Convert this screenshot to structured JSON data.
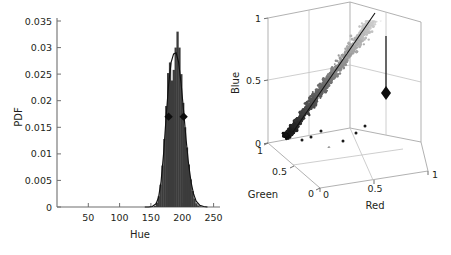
{
  "figure": {
    "background_color": "#ffffff",
    "ink_color": "#231f20"
  },
  "panels": [
    {
      "id": "hue-pdf",
      "type": "histogram-density"
    },
    {
      "id": "rgb-scatter3d",
      "type": "scatter3d"
    }
  ],
  "left_panel": {
    "xlabel": "Hue",
    "ylabel": "PDF",
    "x_ticks": [
      "50",
      "100",
      "150",
      "200",
      "250"
    ],
    "y_ticks": [
      "0",
      "0.005",
      "0.01",
      "0.015",
      "0.02",
      "0.025",
      "0.03",
      "0.035"
    ]
  },
  "right_panel": {
    "xlabel": "Red",
    "ylabel": "Green",
    "zlabel": "Blue",
    "red_ticks": [
      "0",
      "0.5",
      "1"
    ],
    "green_ticks": [
      "1",
      "0.5",
      "0"
    ],
    "blue_ticks": [
      "0",
      "0.5",
      "1"
    ]
  },
  "chart_data": [
    {
      "type": "bar",
      "id": "hue-pdf",
      "title": "",
      "xlabel": "Hue",
      "ylabel": "PDF",
      "xlim": [
        0,
        260
      ],
      "ylim": [
        0,
        0.035
      ],
      "xticks": [
        50,
        100,
        150,
        200,
        250
      ],
      "yticks": [
        0,
        0.005,
        0.01,
        0.015,
        0.02,
        0.025,
        0.03,
        0.035
      ],
      "grid": false,
      "legend": "none",
      "bar_color": "#3c3c3c",
      "series": [
        {
          "name": "Hue histogram (PDF)",
          "kind": "bar",
          "x": [
            150,
            153,
            156,
            159,
            162,
            165,
            168,
            171,
            174,
            177,
            180,
            183,
            186,
            189,
            192,
            195,
            198,
            201,
            204,
            207,
            210,
            213,
            216,
            219,
            222,
            225,
            228,
            231
          ],
          "values": [
            0.0,
            0.0,
            0.0002,
            0.0008,
            0.002,
            0.0042,
            0.0078,
            0.0128,
            0.019,
            0.0252,
            0.0272,
            0.0238,
            0.0258,
            0.03,
            0.033,
            0.03,
            0.025,
            0.0196,
            0.015,
            0.0112,
            0.008,
            0.0052,
            0.003,
            0.0016,
            0.0007,
            0.0003,
            0.0001,
            0.0
          ]
        },
        {
          "name": "Fitted density curve",
          "kind": "line",
          "color": "#111111",
          "x": [
            140,
            146,
            152,
            158,
            162,
            166,
            170,
            174,
            178,
            182,
            186,
            190,
            194,
            198,
            202,
            206,
            210,
            214,
            218,
            222,
            228,
            234,
            240
          ],
          "values": [
            0.0,
            0.0,
            0.0001,
            0.0006,
            0.0018,
            0.0048,
            0.01,
            0.0168,
            0.023,
            0.0272,
            0.0288,
            0.029,
            0.0272,
            0.0232,
            0.018,
            0.0126,
            0.008,
            0.0046,
            0.0024,
            0.0011,
            0.0003,
            0.0001,
            0.0
          ]
        },
        {
          "name": "Interval markers",
          "kind": "marker",
          "marker": "diamond",
          "color": "#0d0d0d",
          "points": [
            {
              "x": 178,
              "y": 0.017
            },
            {
              "x": 202,
              "y": 0.017
            }
          ]
        }
      ]
    },
    {
      "type": "scatter",
      "id": "rgb-scatter3d",
      "title": "",
      "xlabel": "Red",
      "ylabel": "Green",
      "zlabel": "Blue",
      "xlim": [
        0,
        1
      ],
      "ylim": [
        0,
        1
      ],
      "zlim": [
        0,
        1
      ],
      "xticks": [
        0,
        0.5,
        1
      ],
      "yticks": [
        0,
        0.5,
        1
      ],
      "zticks": [
        0,
        0.5,
        1
      ],
      "grid": true,
      "legend": "none",
      "projection": "3d",
      "note": "Dense elongated RGB cloud along the gray/achromatic diagonal, shaded dark at low values to light at high values, with a fitted trend line and a diamond marker on the back-right wall connected by a vertical drop line.",
      "series": [
        {
          "name": "RGB samples",
          "kind": "points",
          "shading": "dark-to-light along axis",
          "count_approx": 1200
        },
        {
          "name": "Principal axis / trend line",
          "kind": "line",
          "color": "#111111",
          "from": [
            0.18,
            0.18,
            0.18
          ],
          "to": [
            0.92,
            0.92,
            0.92
          ]
        },
        {
          "name": "Projection marker",
          "kind": "marker",
          "marker": "diamond",
          "color": "#0d0d0d",
          "point": [
            1.0,
            0.55,
            0.52
          ]
        }
      ]
    }
  ]
}
